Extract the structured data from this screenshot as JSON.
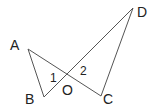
{
  "diagram": {
    "points": {
      "A": "A",
      "B": "B",
      "C": "C",
      "D": "D",
      "O": "O"
    },
    "angles": {
      "angle1": "1",
      "angle2": "2"
    },
    "segments": [
      "AB",
      "AC",
      "BD",
      "DC"
    ],
    "colors": {
      "line": "#555555",
      "text": "#222222"
    }
  }
}
